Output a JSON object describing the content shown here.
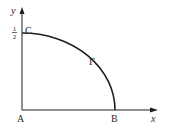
{
  "diagram": {
    "axes": {
      "x_label": "x",
      "y_label": "y"
    },
    "points": {
      "origin": "A",
      "x_intercept": "B",
      "y_intercept": "C"
    },
    "curve_label": "Γ",
    "y_tick": {
      "numerator": "1",
      "denominator": "2"
    },
    "colors": {
      "stroke": "#1e1e1e",
      "text": "#2a2a2a",
      "background": "#ffffff"
    }
  }
}
